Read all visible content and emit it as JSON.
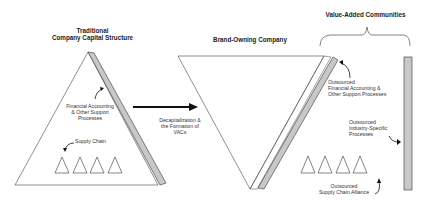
{
  "titles": {
    "traditional_line1": "Traditional",
    "traditional_line2": "Company Capital Structure",
    "brand_owning": "Brand-Owning Company",
    "vac": "Value-Added Communities"
  },
  "left": {
    "support_line1": "Financial Accounting",
    "support_line2": "& Other Support",
    "support_line3": "Processes",
    "supply_chain": "Supply Chain"
  },
  "transition": {
    "line1": "Decapitalization &",
    "line2": "the Formation of",
    "line3": "VACs"
  },
  "right": {
    "fin_line1": "Outsourced",
    "fin_line2": "Financial Accounting &",
    "fin_line3": "Other Support Processes",
    "ind_line1": "Outsourced",
    "ind_line2": "Industry-Specific",
    "ind_line3": "Processes",
    "sca_line1": "Outsourced",
    "sca_line2": "Supply Chain Alliance"
  },
  "colors": {
    "line": "#333333",
    "bar_fill": "#c8c8c8",
    "arrow": "#111111"
  }
}
